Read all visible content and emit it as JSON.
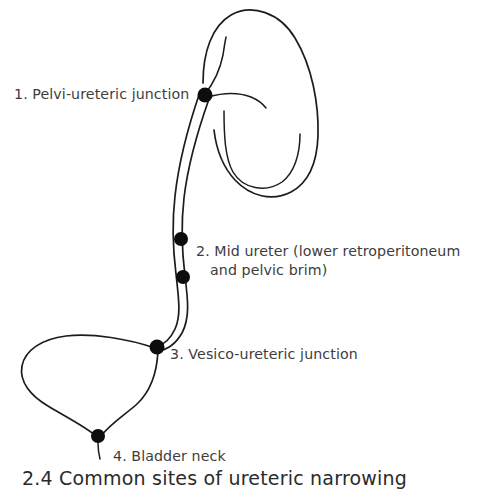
{
  "figure": {
    "background_color": "#ffffff",
    "line_color": "#1c1c1c",
    "marker_color": "#0d0d0d",
    "text_color": "#3d3d3d"
  },
  "labels": {
    "item1": "1. Pelvi-ureteric junction",
    "item2_line1": "2. Mid ureter (lower retroperitoneum",
    "item2_line2": "and pelvic brim)",
    "item3": "3. Vesico-ureteric junction",
    "item4": "4. Bladder neck"
  },
  "caption": "2.4 Common sites of ureteric narrowing",
  "markers": [
    {
      "id": 1,
      "name": "pelvi-ureteric-junction",
      "x": 205,
      "y": 95,
      "r": 7.5
    },
    {
      "id": 2,
      "name": "mid-ureter-upper",
      "x": 181,
      "y": 239,
      "r": 7
    },
    {
      "id": 3,
      "name": "mid-ureter-lower",
      "x": 183,
      "y": 277,
      "r": 7
    },
    {
      "id": 4,
      "name": "vesico-ureteric-junction",
      "x": 157,
      "y": 347,
      "r": 7.5
    },
    {
      "id": 5,
      "name": "bladder-neck",
      "x": 98,
      "y": 436,
      "r": 7
    }
  ],
  "structures": [
    {
      "name": "kidney",
      "description": "Right kidney, bean shaped with medial hilum"
    },
    {
      "name": "ureter",
      "description": "Tubular double-line ureter from renal pelvis to bladder"
    },
    {
      "name": "bladder",
      "description": "Urinary bladder, rounded triangular with inferior neck"
    }
  ]
}
